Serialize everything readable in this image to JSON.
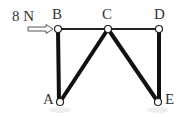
{
  "diagram": {
    "type": "truss",
    "force": {
      "label": "8 N",
      "applied_at": "B",
      "direction": "right"
    },
    "nodes": [
      {
        "id": "A",
        "label": "A",
        "x": 60,
        "y": 102
      },
      {
        "id": "B",
        "label": "B",
        "x": 58,
        "y": 29
      },
      {
        "id": "C",
        "label": "C",
        "x": 108,
        "y": 29
      },
      {
        "id": "D",
        "label": "D",
        "x": 159,
        "y": 29
      },
      {
        "id": "E",
        "label": "E",
        "x": 158,
        "y": 102
      }
    ],
    "members": [
      [
        "B",
        "C"
      ],
      [
        "C",
        "D"
      ],
      [
        "B",
        "A"
      ],
      [
        "C",
        "A"
      ],
      [
        "C",
        "E"
      ],
      [
        "D",
        "E"
      ]
    ],
    "colors": {
      "member": "#111111",
      "thin_member": "#222222",
      "node_fill": "#ffffff",
      "text": "#333333"
    }
  }
}
